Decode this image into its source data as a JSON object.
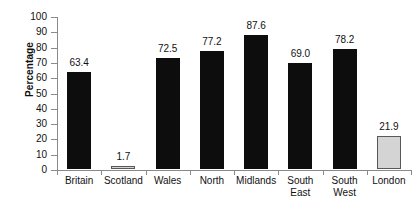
{
  "chart_data": {
    "type": "bar",
    "title": "",
    "xlabel": "",
    "ylabel": "Percentage",
    "ylim": [
      0,
      100
    ],
    "yticks": [
      0,
      10,
      20,
      30,
      40,
      50,
      60,
      70,
      80,
      90,
      100
    ],
    "grid": false,
    "legend": "none",
    "categories": [
      "Britain",
      "Scotland",
      "Wales",
      "North",
      "Midlands",
      "South East",
      "South West",
      "London"
    ],
    "category_lines": [
      [
        "Britain"
      ],
      [
        "Scotland"
      ],
      [
        "Wales"
      ],
      [
        "North"
      ],
      [
        "Midlands"
      ],
      [
        "South",
        "East"
      ],
      [
        "South",
        "West"
      ],
      [
        "London"
      ]
    ],
    "values": [
      63.4,
      1.7,
      72.5,
      77.2,
      87.6,
      69.0,
      78.2,
      21.9
    ],
    "value_labels": [
      "63.4",
      "1.7",
      "72.5",
      "77.2",
      "87.6",
      "69.0",
      "78.2",
      "21.9"
    ],
    "bar_colors": [
      "#0d0d0d",
      "#d4d4d4",
      "#0d0d0d",
      "#0d0d0d",
      "#0d0d0d",
      "#0d0d0d",
      "#0d0d0d",
      "#d4d4d4"
    ],
    "bar_styles": [
      "dark",
      "light",
      "dark",
      "dark",
      "dark",
      "dark",
      "dark",
      "light"
    ]
  },
  "axis": {
    "y_tick_labels": [
      "0",
      "10",
      "20",
      "30",
      "40",
      "50",
      "60",
      "70",
      "80",
      "90",
      "100"
    ],
    "y_title": "Percentage",
    "axis_color": "#8a8a8a"
  },
  "caption": {
    "text": ""
  }
}
